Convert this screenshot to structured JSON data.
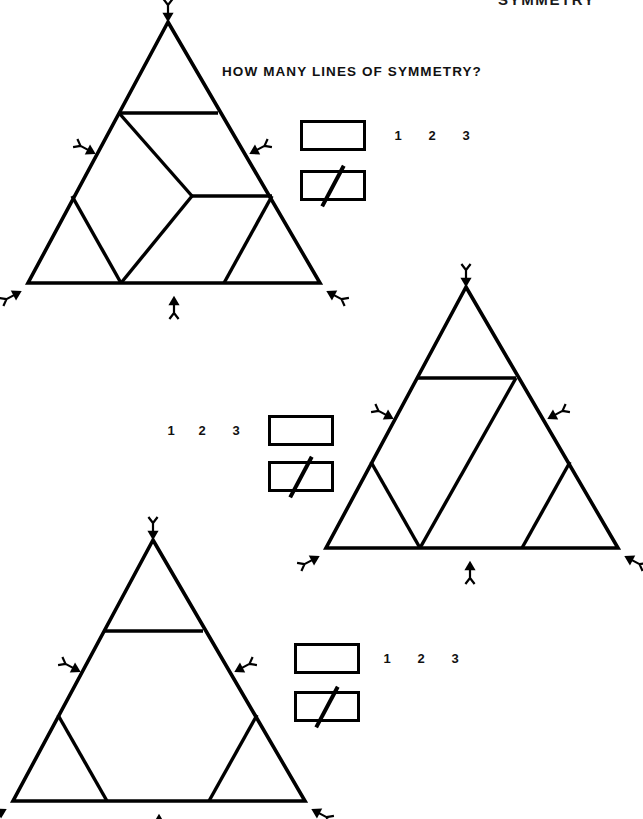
{
  "header": {
    "title": "SYMMETRY"
  },
  "prompt": {
    "text": "HOW MANY LINES OF SYMMETRY?"
  },
  "colors": {
    "ink": "#000000",
    "paper": "#ffffff"
  },
  "choices": {
    "options": [
      "1",
      "2",
      "3"
    ]
  },
  "answer_boxes": {
    "empty_label": "",
    "crossed_label": ""
  },
  "problems": [
    {
      "id": "problem-1",
      "figure": "triangle-subdivided-a",
      "choices": [
        "1",
        "2",
        "3"
      ],
      "boxes_side": "left",
      "numbers_side": "right",
      "symmetry_markers": [
        "apex-down-arrow",
        "left-edge-arrow",
        "right-edge-arrow",
        "bottom-left-arrow",
        "bottom-center-up-arrow",
        "bottom-right-arrow"
      ]
    },
    {
      "id": "problem-2",
      "figure": "triangle-subdivided-b",
      "choices": [
        "1",
        "2",
        "3"
      ],
      "boxes_side": "right",
      "numbers_side": "left",
      "symmetry_markers": [
        "apex-down-arrow",
        "left-edge-arrow",
        "right-edge-arrow",
        "bottom-left-arrow",
        "bottom-center-up-arrow",
        "bottom-right-arrow"
      ]
    },
    {
      "id": "problem-3",
      "figure": "triangle-subdivided-c",
      "choices": [
        "1",
        "2",
        "3"
      ],
      "boxes_side": "left",
      "numbers_side": "right",
      "symmetry_markers": [
        "apex-down-arrow",
        "left-edge-arrow",
        "right-edge-arrow",
        "bottom-left-arrow",
        "bottom-center-up-arrow",
        "bottom-right-arrow"
      ]
    }
  ]
}
